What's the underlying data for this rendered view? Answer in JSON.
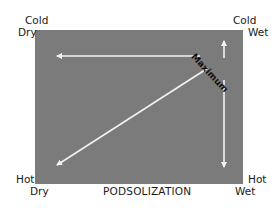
{
  "diagram": {
    "title": "PODSOLIZATION",
    "corners": {
      "top_left": [
        "Cold",
        "Dry"
      ],
      "top_right": [
        "Cold",
        "Wet"
      ],
      "bottom_left": [
        "Hot",
        "Dry"
      ],
      "bottom_right": [
        "Hot",
        "Wet"
      ]
    },
    "annotation": "Maximum",
    "arrows": [
      {
        "from": "Cold Wet (Maximum)",
        "to": "Cold Dry",
        "direction": "left"
      },
      {
        "from": "Cold Wet (Maximum)",
        "to": "Hot Dry",
        "direction": "diagonal-down-left"
      },
      {
        "from": "Cold Wet (Maximum)",
        "to": "Hot Wet",
        "direction": "down"
      },
      {
        "from": "Cold Wet (Maximum)",
        "to": "Cold Wet",
        "direction": "up"
      }
    ],
    "colors": {
      "panel": "#7b7b7b",
      "arrow": "#f2f2f2",
      "text": "#1a1a1a",
      "background": "#ffffff"
    }
  }
}
